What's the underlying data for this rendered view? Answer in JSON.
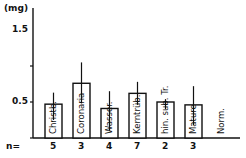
{
  "chart_data": {
    "type": "bar",
    "title": "",
    "xlabel": "",
    "ylabel": "(mg)",
    "ylim": [
      0,
      1.75
    ],
    "yticks": [
      0.5,
      1.0,
      1.5
    ],
    "ytick_labels": [
      "0.5",
      "",
      "1.5"
    ],
    "grid": false,
    "legend": null,
    "categories": [
      "Christb.",
      "Coronaria",
      "Wasser.",
      "Kerntrüb.",
      "hin. sub. Tr.",
      "Mature",
      "Norm."
    ],
    "values": [
      0.97,
      1.26,
      0.91,
      1.12,
      1.0,
      0.96,
      0.5
    ],
    "error_low": [
      0.75,
      0.98,
      0.6,
      0.96,
      0.9,
      0.68,
      null
    ],
    "error_high": [
      1.13,
      1.55,
      1.15,
      1.28,
      1.04,
      1.22,
      null
    ],
    "n_label": "n=",
    "n": [
      "5",
      "3",
      "4",
      "7",
      "2",
      "3",
      ""
    ]
  }
}
